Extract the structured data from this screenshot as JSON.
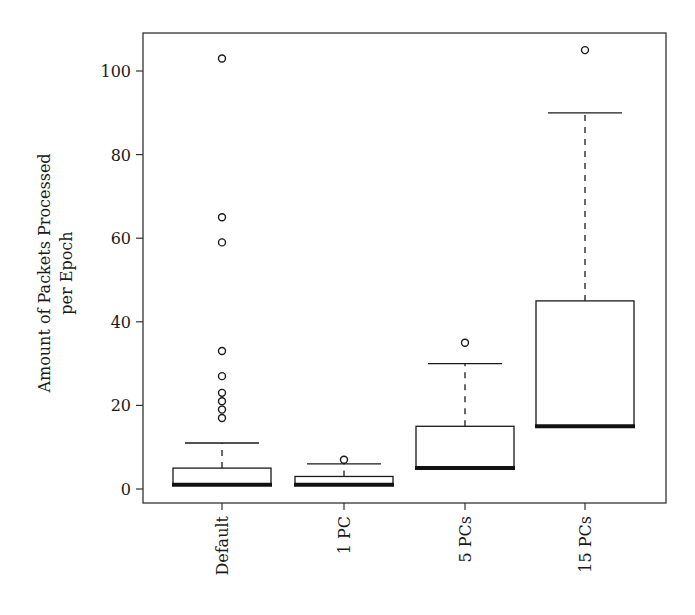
{
  "chart_data": {
    "type": "boxplot",
    "title": "",
    "xlabel": "",
    "ylabel_lines": [
      "Amount of Packets Processed",
      "per Epoch"
    ],
    "ylim": [
      -3,
      109
    ],
    "yticks": [
      0,
      20,
      40,
      60,
      80,
      100
    ],
    "ytick_labels": [
      "0",
      "20",
      "40",
      "60",
      "80",
      "100"
    ],
    "grid": false,
    "legend": "none",
    "categories": [
      "Default",
      "1 PC",
      "5 PCs",
      "15 PCs"
    ],
    "boxes": [
      {
        "name": "Default",
        "whisker_low": 1,
        "q1": 1,
        "median": 1,
        "q3": 5,
        "whisker_high": 11,
        "outliers": [
          17,
          19,
          21,
          23,
          27,
          33,
          59,
          65,
          103
        ]
      },
      {
        "name": "1 PC",
        "whisker_low": 1,
        "q1": 1,
        "median": 1,
        "q3": 3,
        "whisker_high": 6,
        "outliers": [
          7
        ]
      },
      {
        "name": "5 PCs",
        "whisker_low": 5,
        "q1": 5,
        "median": 5,
        "q3": 15,
        "whisker_high": 30,
        "outliers": [
          35
        ]
      },
      {
        "name": "15 PCs",
        "whisker_low": 15,
        "q1": 15,
        "median": 15,
        "q3": 45,
        "whisker_high": 90,
        "outliers": [
          105
        ]
      }
    ],
    "colors": {
      "stroke": "#1a1a1a",
      "fill": "#ffffff"
    }
  }
}
